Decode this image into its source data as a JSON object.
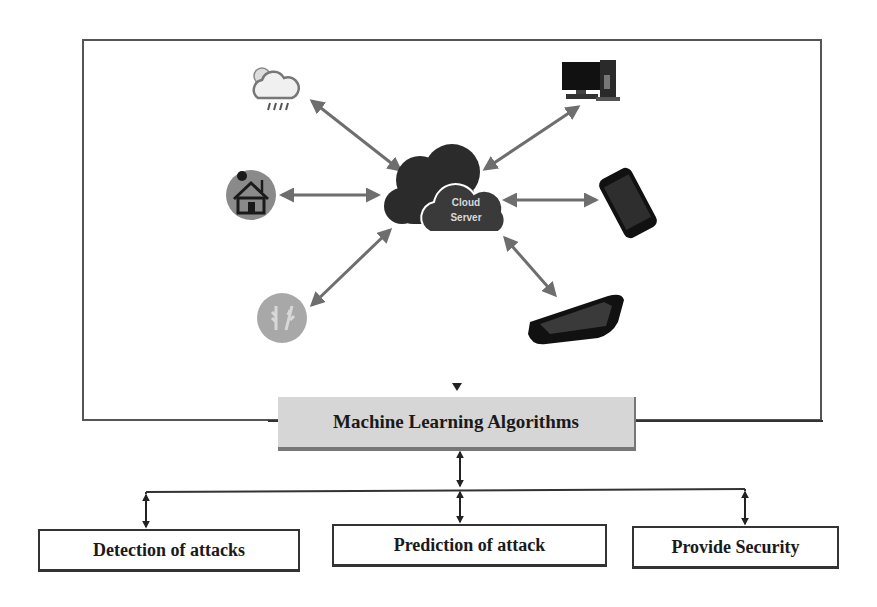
{
  "diagram": {
    "cloud": {
      "line1": "Cloud",
      "line2": "Server"
    },
    "devices": [
      {
        "name": "weather",
        "icon": "weather-cloud-rain-icon"
      },
      {
        "name": "smart-home",
        "icon": "smart-home-icon"
      },
      {
        "name": "agriculture",
        "icon": "agriculture-wheat-icon"
      },
      {
        "name": "desktop-computer",
        "icon": "desktop-computer-icon"
      },
      {
        "name": "smartphone",
        "icon": "smartphone-icon"
      },
      {
        "name": "tablet",
        "icon": "tablet-icon"
      }
    ],
    "ml_box": {
      "label": "Machine Learning Algorithms"
    },
    "outputs": [
      {
        "label": "Detection of attacks"
      },
      {
        "label": "Prediction of attack"
      },
      {
        "label": "Provide Security"
      }
    ],
    "colors": {
      "arrow": "#6e6e6e",
      "cloud": "#2b2b2b",
      "ml_box_fill": "#d6d6d6",
      "frame": "#555555",
      "connector": "#222222"
    }
  }
}
